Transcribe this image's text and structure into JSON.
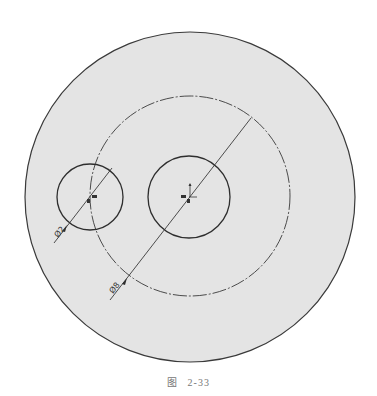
{
  "figure": {
    "caption_prefix": "图",
    "caption_number": "2-33"
  },
  "colors": {
    "disk_fill": "#e4e4e4",
    "stroke": "#3a3a3a",
    "background": "#ffffff"
  },
  "drawing": {
    "outer_disk": {
      "cx": 190,
      "cy": 197,
      "r": 165
    },
    "pitch_circle": {
      "cx": 190,
      "cy": 196,
      "r": 100,
      "style": "dash-dot"
    },
    "center_circle": {
      "cx": 189,
      "cy": 197,
      "r": 41
    },
    "small_circle": {
      "cx": 90,
      "cy": 197,
      "r": 33
    },
    "dimensions": [
      {
        "label": "Ø2",
        "target": "small_circle"
      },
      {
        "label": "Ø8",
        "target": "pitch_circle"
      }
    ]
  }
}
